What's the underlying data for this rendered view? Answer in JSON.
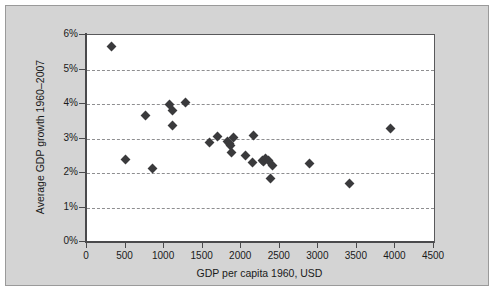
{
  "chart_data": {
    "type": "scatter",
    "title": "",
    "xlabel": "GDP per capita 1960, USD",
    "ylabel": "Average GDP growth 1960–2007",
    "xlim": [
      0,
      4500
    ],
    "ylim": [
      0,
      6
    ],
    "xticks": [
      0,
      500,
      1000,
      1500,
      2000,
      2500,
      3000,
      3500,
      4000,
      4500
    ],
    "xtick_labels": [
      "0",
      "500",
      "1000",
      "1500",
      "2000",
      "2500",
      "3000",
      "3500",
      "4000",
      "4500"
    ],
    "yticks": [
      0,
      1,
      2,
      3,
      4,
      5,
      6
    ],
    "ytick_labels": [
      "0%",
      "1%",
      "2%",
      "3%",
      "4%",
      "5%",
      "6%"
    ],
    "y_unit": "%",
    "grid": "horizontal-dashed",
    "legend": null,
    "marker": "diamond",
    "marker_color": "#3a3a3c",
    "points": [
      {
        "x": 320,
        "y": 5.66
      },
      {
        "x": 495,
        "y": 2.39
      },
      {
        "x": 765,
        "y": 3.67
      },
      {
        "x": 845,
        "y": 2.12
      },
      {
        "x": 1075,
        "y": 4.0
      },
      {
        "x": 1110,
        "y": 3.82
      },
      {
        "x": 1115,
        "y": 3.38
      },
      {
        "x": 1275,
        "y": 4.03
      },
      {
        "x": 1595,
        "y": 2.88
      },
      {
        "x": 1690,
        "y": 3.06
      },
      {
        "x": 1825,
        "y": 2.9
      },
      {
        "x": 1845,
        "y": 2.86
      },
      {
        "x": 1860,
        "y": 2.8
      },
      {
        "x": 1870,
        "y": 2.58
      },
      {
        "x": 1900,
        "y": 3.04
      },
      {
        "x": 2060,
        "y": 2.52
      },
      {
        "x": 2140,
        "y": 2.31
      },
      {
        "x": 2165,
        "y": 3.08
      },
      {
        "x": 2275,
        "y": 2.37
      },
      {
        "x": 2290,
        "y": 2.33
      },
      {
        "x": 2310,
        "y": 2.42
      },
      {
        "x": 2350,
        "y": 2.35
      },
      {
        "x": 2380,
        "y": 1.83
      },
      {
        "x": 2410,
        "y": 2.21
      },
      {
        "x": 2890,
        "y": 2.27
      },
      {
        "x": 3400,
        "y": 1.71
      },
      {
        "x": 3930,
        "y": 3.28
      }
    ]
  },
  "colors": {
    "figure_background": "#d4d4d4",
    "plot_background": "#ffffff",
    "axis": "#4a4a4c",
    "gridline": "#8e8e90",
    "marker": "#3a3a3c",
    "text": "#1a1a1a"
  }
}
